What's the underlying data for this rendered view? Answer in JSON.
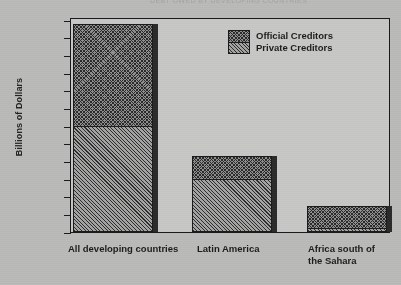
{
  "title_strip": "DEBT OWED BY DEVELOPING COUNTRIES",
  "chart_data": {
    "type": "bar",
    "stacked": true,
    "title": "",
    "xlabel": "",
    "ylabel": "Billions of Dollars",
    "ylim": [
      0,
      1200
    ],
    "ytick_step": 100,
    "ytick_labels": [
      "1,200",
      "1,100",
      "1,000",
      "900",
      "800",
      "700",
      "600",
      "500",
      "400",
      "300",
      "200",
      "100",
      "0"
    ],
    "ytick_values": [
      1200,
      1100,
      1000,
      900,
      800,
      700,
      600,
      500,
      400,
      300,
      200,
      100,
      0
    ],
    "grid": false,
    "legend_position": "top-right",
    "categories": [
      "All developing countries",
      "Latin America",
      "Africa south of\nthe Sahara"
    ],
    "series": [
      {
        "name": "Official Creditors",
        "pattern": "cross-hatch",
        "values": [
          580,
          130,
          125
        ]
      },
      {
        "name": "Private Creditors",
        "pattern": "diagonal-hatch",
        "values": [
          600,
          300,
          25
        ]
      }
    ],
    "totals": [
      1180,
      430,
      150
    ]
  },
  "legend": {
    "items": [
      {
        "label": "Official Creditors"
      },
      {
        "label": "Private Creditors"
      }
    ]
  },
  "colors": {
    "paper": "#b9b9b7",
    "plot_background": "#c6c6c4",
    "ink": "#1a1a1a",
    "hatch": "#2a2a2a"
  }
}
